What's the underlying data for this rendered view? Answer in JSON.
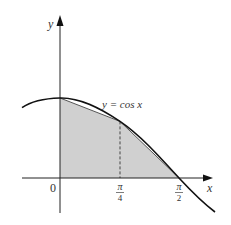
{
  "diagram": {
    "curve_label": "y = cos x",
    "axes": {
      "x_label": "x",
      "y_label": "y",
      "origin_label": "0"
    },
    "ticks": [
      {
        "value": 0.7853981634,
        "numerator": "π",
        "denominator": "4"
      },
      {
        "value": 1.5707963268,
        "numerator": "π",
        "denominator": "2"
      }
    ],
    "shaded_region": {
      "description": "Two trapezoids under chords of y = cos x on [0, π/4] and [π/4, π/2]",
      "vertices": [
        [
          0,
          0
        ],
        [
          0,
          1
        ],
        [
          0.7854,
          0.7071
        ],
        [
          1.5708,
          0
        ],
        [
          0,
          0
        ]
      ],
      "fill": "#d0d0d0"
    },
    "dashed_line": {
      "x": 0.7854,
      "from_y": 0,
      "to_y": 0.7071
    },
    "colors": {
      "curve": "#111111",
      "axis": "#222222",
      "fill": "#d0d0d0",
      "text": "#333333"
    }
  }
}
